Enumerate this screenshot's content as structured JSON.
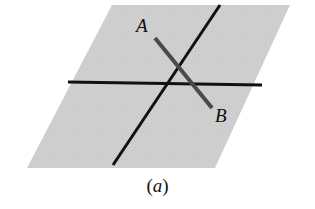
{
  "figure": {
    "caption": {
      "open_paren": "(",
      "letter": "a",
      "close_paren": ")",
      "full": "(a)"
    },
    "labels": {
      "a": "A",
      "b": "B"
    },
    "colors": {
      "background": "#ffffff",
      "plane_fill": "#cdcdcd",
      "plane_fill_light": "#d6d6d6",
      "line_black": "#111111",
      "segment_gray": "#4a4a4a",
      "text": "#0d0d0d"
    },
    "geometry": {
      "plane": {
        "name": "shaded-plane-parallelogram",
        "points": "112,5 290,5 215,168 27,168"
      },
      "horizontal_line": {
        "name": "horizontal-line",
        "x1": 68,
        "y1": 82,
        "x2": 262,
        "y2": 85,
        "width": 3
      },
      "diagonal_line": {
        "name": "diagonal-line",
        "x1": 220,
        "y1": 5,
        "x2": 113,
        "y2": 165,
        "width": 3
      },
      "segment_ab": {
        "name": "segment-a-b",
        "x1": 155,
        "y1": 38,
        "x2": 212,
        "y2": 108,
        "width": 4
      }
    }
  }
}
